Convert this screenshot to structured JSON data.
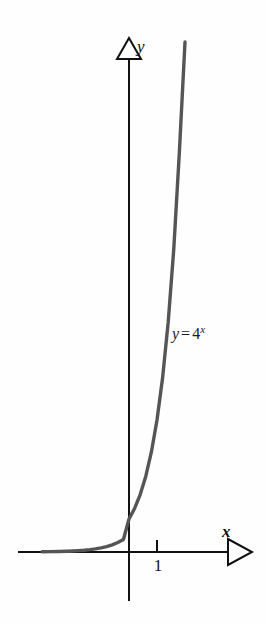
{
  "figure": {
    "background_color": "#fefefe",
    "axis_color": "#111111",
    "curve_color": "#555555",
    "y_axis_label": "y",
    "x_axis_label": "x",
    "tick_label_one": "1",
    "equation": {
      "lhs": "y",
      "equals": "=",
      "base": "4",
      "exponent": "x",
      "full": "y = 4^x"
    }
  },
  "chart_data": {
    "type": "line",
    "title": "",
    "xlabel": "x",
    "ylabel": "y",
    "equation": "y = 4^x",
    "function": "4^x",
    "base": 4,
    "legend": [],
    "legend_position": "none",
    "grid": false,
    "annotations": [
      "y = 4^x"
    ],
    "xlim": [
      -3.1,
      3.5
    ],
    "ylim": [
      -0.2,
      18
    ],
    "xticks": [
      1
    ],
    "xtick_labels": [
      "1"
    ],
    "yticks": [],
    "ytick_labels": [],
    "x": [
      -3.1,
      -2.8,
      -2.5,
      -2.2,
      -2.0,
      -1.8,
      -1.6,
      -1.4,
      -1.2,
      -1.0,
      -0.8,
      -0.6,
      -0.4,
      -0.2,
      0.0,
      0.2,
      0.4,
      0.6,
      0.8,
      1.0,
      1.2,
      1.4,
      1.6,
      1.8,
      2.0,
      2.1
    ],
    "values": [
      0.0066,
      0.0102,
      0.0156,
      0.0237,
      0.0313,
      0.0413,
      0.0546,
      0.0722,
      0.0954,
      0.125,
      0.1649,
      0.2176,
      0.2872,
      0.3789,
      1.0,
      1.32,
      1.741,
      2.297,
      3.031,
      4.0,
      5.278,
      6.964,
      9.19,
      12.13,
      16.0,
      18.38
    ],
    "series": [
      {
        "name": "y = 4^x",
        "color": "#555555",
        "values": [
          0.0066,
          0.0102,
          0.0156,
          0.0237,
          0.0313,
          0.0413,
          0.0546,
          0.0722,
          0.0954,
          0.125,
          0.1649,
          0.2176,
          0.2872,
          0.3789,
          1.0,
          1.32,
          1.741,
          2.297,
          3.031,
          4.0,
          5.278,
          6.964,
          9.19,
          12.13,
          16.0,
          18.38
        ]
      }
    ]
  }
}
